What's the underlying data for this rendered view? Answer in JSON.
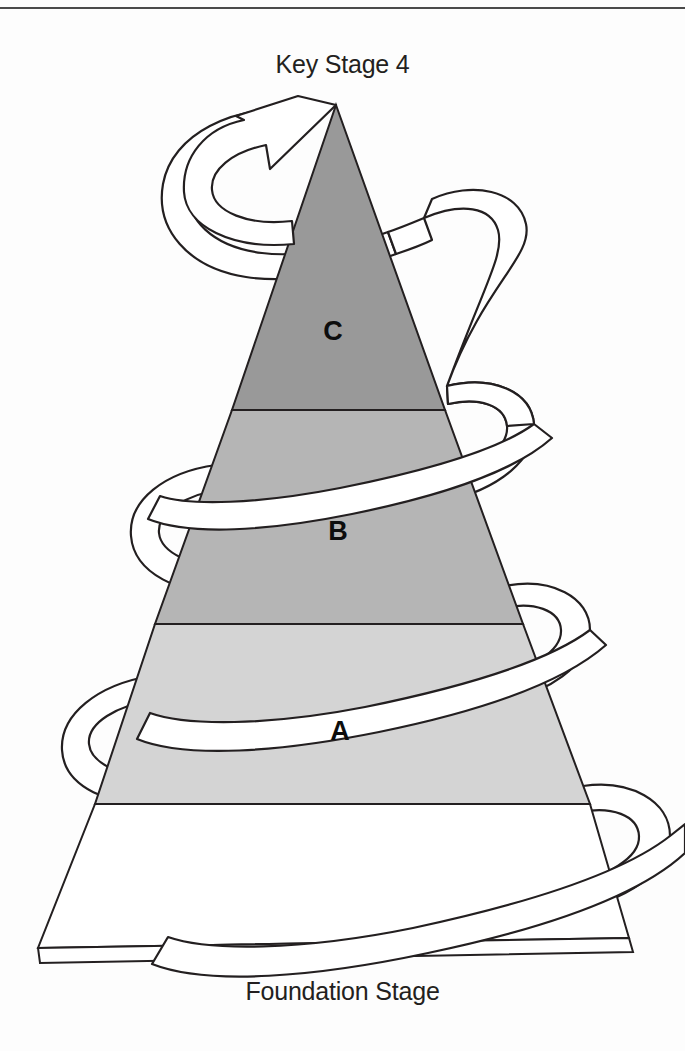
{
  "diagram": {
    "title_top": "Key Stage 4",
    "title_bottom": "Foundation Stage",
    "type": "spiral-curriculum-pyramid",
    "top_rule_color": "#4a4a4a",
    "background_color": "#fdfdfd",
    "outline_color": "#231f20",
    "ribbon_fill": "#ffffff",
    "bands": [
      {
        "label": "C",
        "fill": "#999999",
        "position": "top",
        "label_x": 333,
        "label_y": 340
      },
      {
        "label": "B",
        "fill": "#b5b5b5",
        "position": "middle",
        "label_x": 338,
        "label_y": 540
      },
      {
        "label": "A",
        "fill": "#d4d4d4",
        "position": "lower",
        "label_x": 340,
        "label_y": 740
      },
      {
        "label": "",
        "fill": "#ffffff",
        "position": "base",
        "label_x": 0,
        "label_y": 0
      }
    ],
    "arrow": {
      "name": "spiral-arrow",
      "direction": "up",
      "points_to": "Key Stage 4"
    }
  }
}
